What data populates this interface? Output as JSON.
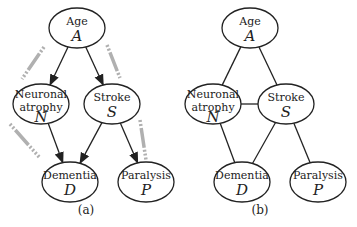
{
  "diagrams": [
    {
      "caption": "(a)",
      "type": "directed",
      "nodes": [
        {
          "id": "A",
          "label": "Age",
          "var": "A",
          "cx": 77,
          "cy": 28
        },
        {
          "id": "N",
          "label": "Neuronal",
          "label2": "atrophy",
          "var": "N",
          "cx": 41,
          "cy": 104
        },
        {
          "id": "S",
          "label": "Stroke",
          "var": "S",
          "cx": 112,
          "cy": 104
        },
        {
          "id": "D",
          "label": "Dementia",
          "var": "D",
          "cx": 70,
          "cy": 182
        },
        {
          "id": "P",
          "label": "Paralysis",
          "var": "P",
          "cx": 146,
          "cy": 182
        }
      ],
      "edges": [
        [
          "A",
          "N"
        ],
        [
          "A",
          "S"
        ],
        [
          "N",
          "D"
        ],
        [
          "S",
          "D"
        ],
        [
          "S",
          "P"
        ]
      ]
    },
    {
      "caption": "(b)",
      "type": "undirected",
      "nodes": [
        {
          "id": "A",
          "label": "Age",
          "var": "A",
          "cx": 250,
          "cy": 28
        },
        {
          "id": "N",
          "label": "Neuronal",
          "label2": "atrophy",
          "var": "N",
          "cx": 213,
          "cy": 104
        },
        {
          "id": "S",
          "label": "Stroke",
          "var": "S",
          "cx": 286,
          "cy": 104
        },
        {
          "id": "D",
          "label": "Dementia",
          "var": "D",
          "cx": 242,
          "cy": 182
        },
        {
          "id": "P",
          "label": "Paralysis",
          "var": "P",
          "cx": 318,
          "cy": 182
        }
      ],
      "edges": [
        [
          "A",
          "N"
        ],
        [
          "A",
          "S"
        ],
        [
          "N",
          "S"
        ],
        [
          "N",
          "D"
        ],
        [
          "S",
          "D"
        ],
        [
          "S",
          "P"
        ]
      ]
    }
  ]
}
